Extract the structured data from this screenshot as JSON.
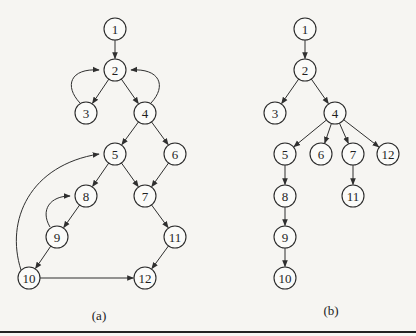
{
  "figure": {
    "captions": [
      {
        "id": "a",
        "label": "(a)",
        "x": 99,
        "y": 308
      },
      {
        "id": "b",
        "label": "(b)",
        "x": 331,
        "y": 303
      }
    ],
    "rule_y": 331,
    "node_radius": 11
  },
  "graphs": [
    {
      "id": "a",
      "name": "control-flow-graph",
      "nodes": [
        {
          "id": "1",
          "x": 115,
          "y": 29
        },
        {
          "id": "2",
          "x": 115,
          "y": 70
        },
        {
          "id": "3",
          "x": 86,
          "y": 113
        },
        {
          "id": "4",
          "x": 145,
          "y": 113
        },
        {
          "id": "5",
          "x": 115,
          "y": 154
        },
        {
          "id": "6",
          "x": 175,
          "y": 154
        },
        {
          "id": "7",
          "x": 145,
          "y": 196
        },
        {
          "id": "8",
          "x": 86,
          "y": 196
        },
        {
          "id": "9",
          "x": 57,
          "y": 237
        },
        {
          "id": "10",
          "x": 29,
          "y": 278
        },
        {
          "id": "11",
          "x": 175,
          "y": 237
        },
        {
          "id": "12",
          "x": 145,
          "y": 278
        }
      ],
      "edges": [
        {
          "from": "1",
          "to": "2"
        },
        {
          "from": "2",
          "to": "3"
        },
        {
          "from": "3",
          "to": "2",
          "curve": "M80,103 C64,86 70,68 99,70"
        },
        {
          "from": "2",
          "to": "4"
        },
        {
          "from": "4",
          "to": "2",
          "curve": "M151,103 C167,86 160,68 131,70"
        },
        {
          "from": "4",
          "to": "5"
        },
        {
          "from": "4",
          "to": "6"
        },
        {
          "from": "5",
          "to": "8"
        },
        {
          "from": "5",
          "to": "7"
        },
        {
          "from": "6",
          "to": "7"
        },
        {
          "from": "8",
          "to": "9"
        },
        {
          "from": "9",
          "to": "8",
          "curve": "M50,227 C40,210 50,196 70,196"
        },
        {
          "from": "9",
          "to": "10"
        },
        {
          "from": "10",
          "to": "5",
          "curve": "M21,270 C5,220 30,165 99,154"
        },
        {
          "from": "10",
          "to": "12"
        },
        {
          "from": "7",
          "to": "11"
        },
        {
          "from": "11",
          "to": "12"
        }
      ]
    },
    {
      "id": "b",
      "name": "dominator-tree",
      "nodes": [
        {
          "id": "1",
          "x": 305,
          "y": 29
        },
        {
          "id": "2",
          "x": 305,
          "y": 70
        },
        {
          "id": "3",
          "x": 275,
          "y": 113
        },
        {
          "id": "4",
          "x": 335,
          "y": 113
        },
        {
          "id": "5",
          "x": 285,
          "y": 154
        },
        {
          "id": "6",
          "x": 321,
          "y": 154
        },
        {
          "id": "7",
          "x": 353,
          "y": 154
        },
        {
          "id": "12",
          "x": 388,
          "y": 154
        },
        {
          "id": "8",
          "x": 285,
          "y": 196
        },
        {
          "id": "11",
          "x": 353,
          "y": 196
        },
        {
          "id": "9",
          "x": 285,
          "y": 237
        },
        {
          "id": "10",
          "x": 285,
          "y": 278
        }
      ],
      "edges": [
        {
          "from": "1",
          "to": "2"
        },
        {
          "from": "2",
          "to": "3"
        },
        {
          "from": "2",
          "to": "4"
        },
        {
          "from": "4",
          "to": "5"
        },
        {
          "from": "4",
          "to": "6"
        },
        {
          "from": "4",
          "to": "7"
        },
        {
          "from": "4",
          "to": "12"
        },
        {
          "from": "5",
          "to": "8"
        },
        {
          "from": "8",
          "to": "9"
        },
        {
          "from": "9",
          "to": "10"
        },
        {
          "from": "7",
          "to": "11"
        }
      ]
    }
  ]
}
